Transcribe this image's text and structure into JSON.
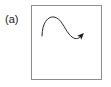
{
  "figure": {
    "panel_label": "(a)",
    "background_color": "#ffffff",
    "frame": {
      "stroke_color": "#8d8d8d",
      "stroke_width": 1,
      "x": 31,
      "y": 5,
      "width": 71,
      "height": 75
    },
    "label_color": "#1a1a1a",
    "label_font_size": 11
  },
  "chart_data": {
    "type": "line",
    "title": "(a)",
    "xlabel": "",
    "ylabel": "",
    "grid": false,
    "legend": null,
    "axes_visible": false,
    "xlim": [
      0,
      72
    ],
    "ylim": [
      0,
      76
    ],
    "annotations": [
      {
        "name": "panel-label",
        "text": "(a)",
        "x": 5,
        "y": 19
      }
    ],
    "series": [
      {
        "name": "s-curve-with-arrow",
        "stroke_color": "#2b2b2b",
        "stroke_width": 1,
        "marker_end": "filled-arrowhead",
        "path": "M 11 31 C 11 18, 17 11, 23 12 C 30 13, 33 23, 38 29 C 42 34, 46 35, 49 32",
        "x": [
          11,
          14,
          17,
          20,
          23,
          26,
          29,
          32,
          35,
          38,
          41,
          44,
          47,
          49
        ],
        "y": [
          31,
          24,
          17,
          13,
          12,
          14,
          18,
          22,
          26,
          29,
          32,
          34,
          34,
          32
        ],
        "arrowhead": {
          "tip_x": 51,
          "tip_y": 21,
          "fill_color": "#1a1a1a",
          "direction_deg": -55,
          "length": 9,
          "width": 7
        }
      }
    ]
  }
}
